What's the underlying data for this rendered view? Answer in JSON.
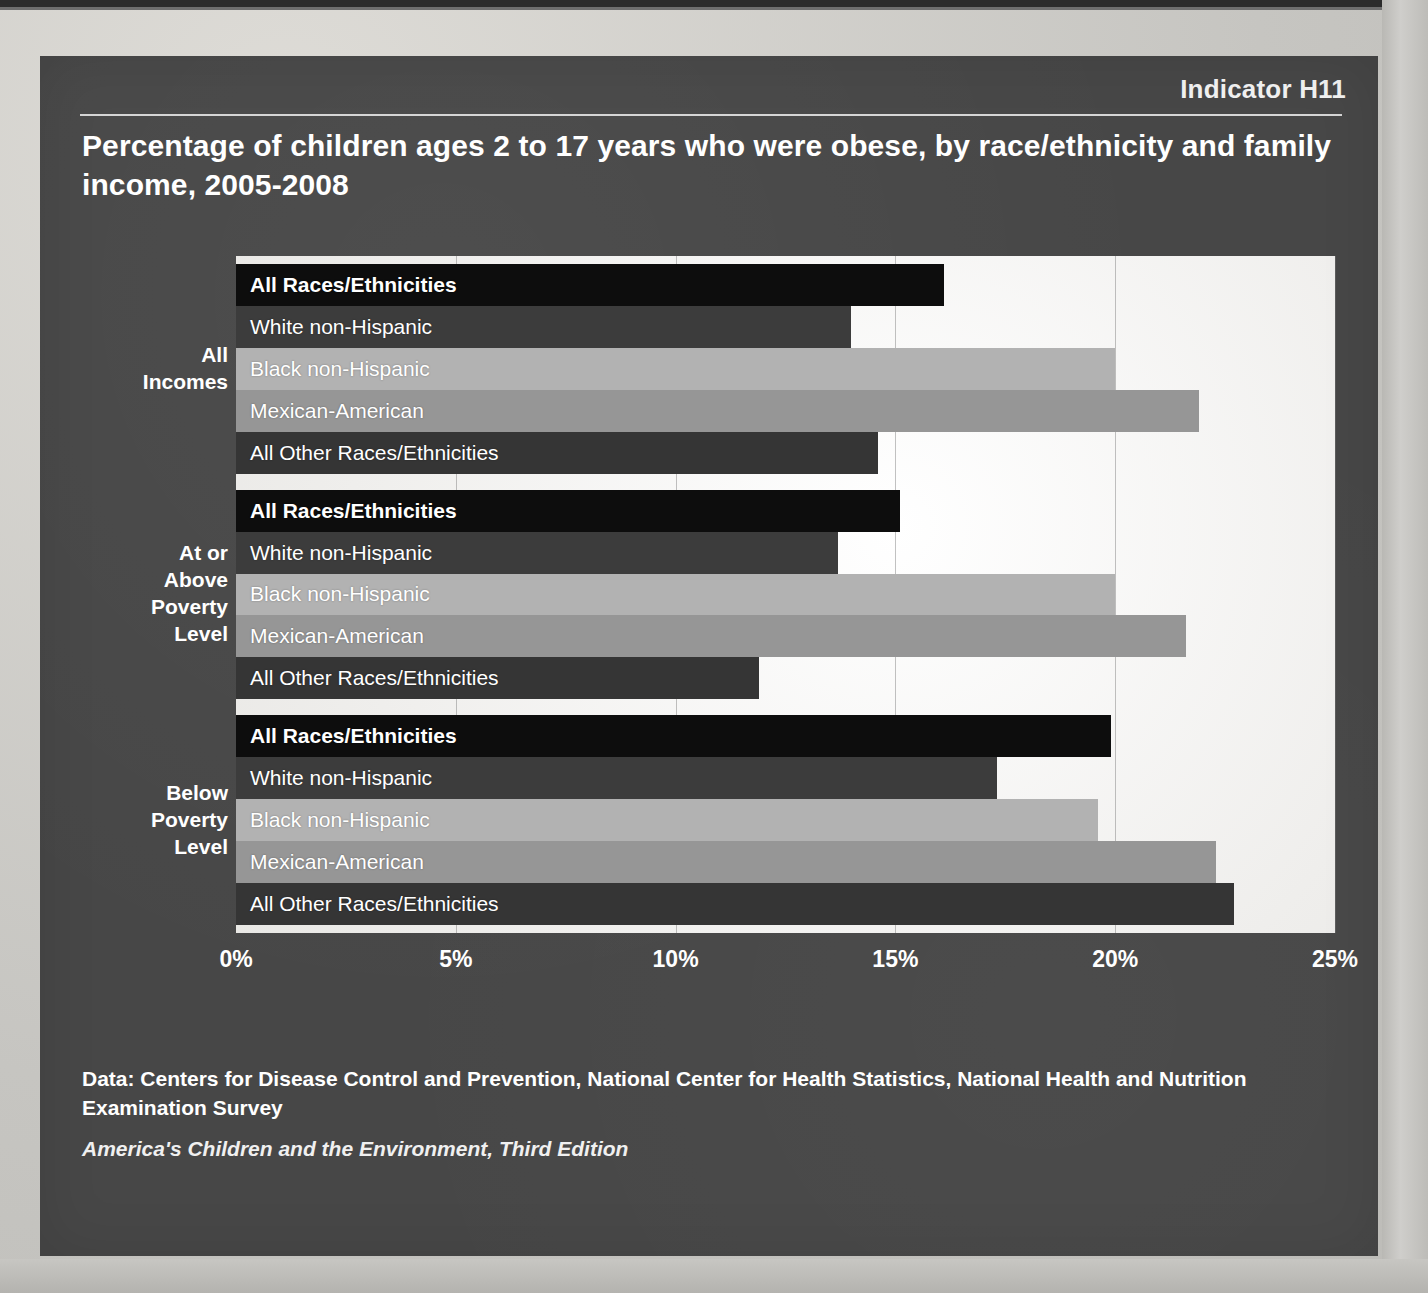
{
  "header": {
    "indicator": "Indicator H11",
    "title": "Percentage of children ages 2 to 17 years who were obese, by race/ethnicity and family income, 2005-2008"
  },
  "footer": {
    "source": "Data: Centers for Disease Control and Prevention, National Center for Health Statistics, National Health and Nutrition Examination Survey",
    "publication": "America's Children and the Environment, Third Edition"
  },
  "colors": {
    "panel_background": "#474747",
    "plot_background": "#f4f3f1",
    "series_all_races": "#0d0d0d",
    "series_white": "#3c3c3c",
    "series_black": "#b2b2b2",
    "series_mexican": "#969696",
    "series_all_other": "#353535",
    "text": "#ffffff",
    "gridline": "#787878"
  },
  "axis": {
    "ticks": [
      "0%",
      "5%",
      "10%",
      "15%",
      "20%",
      "25%"
    ],
    "tick_values": [
      0,
      5,
      10,
      15,
      20,
      25
    ],
    "min": 0,
    "max": 25
  },
  "group_labels": {
    "all_incomes": "All\nIncomes",
    "at_or_above": "At or\nAbove\nPoverty\nLevel",
    "below": "Below\nPoverty\nLevel"
  },
  "chart_data": {
    "type": "bar",
    "orientation": "horizontal",
    "title": "Percentage of children ages 2 to 17 years who were obese, by race/ethnicity and family income, 2005-2008",
    "xlabel": "",
    "ylabel": "",
    "xlim": [
      0,
      25
    ],
    "xticks": [
      0,
      5,
      10,
      15,
      20,
      25
    ],
    "xticklabels": [
      "0%",
      "5%",
      "10%",
      "15%",
      "20%",
      "25%"
    ],
    "grid": true,
    "legend": "none",
    "categories": [
      "All Races/Ethnicities",
      "White non-Hispanic",
      "Black non-Hispanic",
      "Mexican-American",
      "All Other Races/Ethnicities"
    ],
    "groups": [
      {
        "name": "All Incomes",
        "label": "All\nIncomes",
        "bars": [
          {
            "category": "All Races/Ethnicities",
            "value": 16.1,
            "color": "#0d0d0d",
            "bold": true
          },
          {
            "category": "White non-Hispanic",
            "value": 14.0,
            "color": "#3c3c3c",
            "bold": false
          },
          {
            "category": "Black non-Hispanic",
            "value": 20.0,
            "color": "#b2b2b2",
            "bold": false
          },
          {
            "category": "Mexican-American",
            "value": 21.9,
            "color": "#969696",
            "bold": false
          },
          {
            "category": "All Other Races/Ethnicities",
            "value": 14.6,
            "color": "#353535",
            "bold": false
          }
        ]
      },
      {
        "name": "At or Above Poverty Level",
        "label": "At or\nAbove\nPoverty\nLevel",
        "bars": [
          {
            "category": "All Races/Ethnicities",
            "value": 15.1,
            "color": "#0d0d0d",
            "bold": true
          },
          {
            "category": "White non-Hispanic",
            "value": 13.7,
            "color": "#3c3c3c",
            "bold": false
          },
          {
            "category": "Black non-Hispanic",
            "value": 20.0,
            "color": "#b2b2b2",
            "bold": false
          },
          {
            "category": "Mexican-American",
            "value": 21.6,
            "color": "#969696",
            "bold": false
          },
          {
            "category": "All Other Races/Ethnicities",
            "value": 11.9,
            "color": "#353535",
            "bold": false
          }
        ]
      },
      {
        "name": "Below Poverty Level",
        "label": "Below\nPoverty\nLevel",
        "bars": [
          {
            "category": "All Races/Ethnicities",
            "value": 19.9,
            "color": "#0d0d0d",
            "bold": true
          },
          {
            "category": "White non-Hispanic",
            "value": 17.3,
            "color": "#3c3c3c",
            "bold": false
          },
          {
            "category": "Black non-Hispanic",
            "value": 19.6,
            "color": "#b2b2b2",
            "bold": false
          },
          {
            "category": "Mexican-American",
            "value": 22.3,
            "color": "#969696",
            "bold": false
          },
          {
            "category": "All Other Races/Ethnicities",
            "value": 22.7,
            "color": "#353535",
            "bold": false
          }
        ]
      }
    ]
  }
}
